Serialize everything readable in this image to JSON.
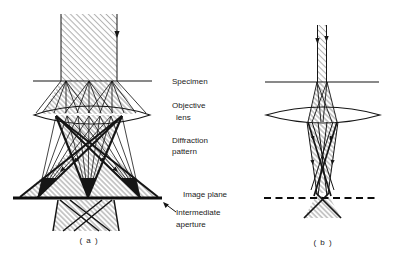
{
  "figure": {
    "type": "electron-microscope-ray-diagram",
    "labels": {
      "specimen": "Specimen",
      "objective_line1": "Objective",
      "objective_line2": "lens",
      "diffraction_line1": "Diffraction",
      "diffraction_line2": "pattern",
      "image_plane": "Image plane",
      "intermediate_line1": "Intermediate",
      "intermediate_line2": "aperture"
    },
    "captions": {
      "panel_a": "( a )",
      "panel_b": "( b )"
    },
    "icons": {
      "beam_arrow": "filled-down-arrowhead",
      "aperture_pointer": "thin-up-left-arrow"
    },
    "colors": {
      "ink": "#151515",
      "hatch_light": "#9b9b9b",
      "hatch_dark": "#7d7d7d",
      "background": "#ffffff"
    }
  }
}
